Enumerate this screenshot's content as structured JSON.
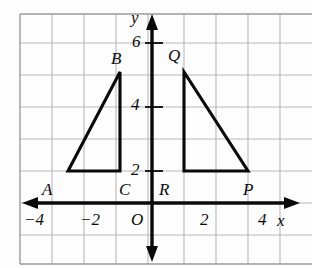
{
  "figure": {
    "kind": "coordinate-plane-geometry-diagram",
    "colors": {
      "grid_line": "#b9b9b9",
      "grid_border": "#9a9a9a",
      "axis": "#0a0a0a",
      "shape_stroke": "#0a0a0a",
      "background": "#fdfdfd",
      "label_text": "#0a0a0a"
    },
    "grid": {
      "cell_px": 32,
      "x_min": -4.125,
      "x_max": 5.0,
      "y_min": -1.9,
      "y_max": 5.9,
      "show_grid": true
    },
    "axes": {
      "x_axis_label": "x",
      "y_axis_label": "y",
      "origin_label": "O",
      "x_ticks": [
        {
          "value": -4,
          "label": "−4"
        },
        {
          "value": -2,
          "label": "−2"
        },
        {
          "value": 2,
          "label": "2"
        },
        {
          "value": 4,
          "label": "4"
        }
      ],
      "y_ticks": [
        {
          "value": 2,
          "label": "2"
        },
        {
          "value": 4,
          "label": "4"
        },
        {
          "value": 6,
          "label": "6"
        }
      ]
    },
    "shapes": [
      {
        "name": "triangle-abc",
        "vertices": [
          {
            "label": "A",
            "x": -3,
            "y": 1
          },
          {
            "label": "B",
            "x": -1,
            "y": 5
          },
          {
            "label": "C",
            "x": -1,
            "y": 1
          }
        ]
      },
      {
        "name": "triangle-pqr",
        "vertices": [
          {
            "label": "R",
            "x": 1,
            "y": 1
          },
          {
            "label": "Q",
            "x": 1,
            "y": 5
          },
          {
            "label": "P",
            "x": 3,
            "y": 1
          }
        ]
      }
    ],
    "point_labels": [
      {
        "name": "A",
        "text": "A",
        "left": 42,
        "top": 181
      },
      {
        "name": "B",
        "text": "B",
        "left": 111,
        "top": 50
      },
      {
        "name": "C",
        "text": "C",
        "left": 119,
        "top": 181
      },
      {
        "name": "R",
        "text": "R",
        "left": 159,
        "top": 181
      },
      {
        "name": "Q",
        "text": "Q",
        "left": 168,
        "top": 47
      },
      {
        "name": "P",
        "text": "P",
        "left": 243,
        "top": 181
      }
    ],
    "tick_labels": [
      {
        "name": "y-tick-6",
        "text": "6",
        "left": 132,
        "top": 33
      },
      {
        "name": "y-tick-4",
        "text": "4",
        "left": 131,
        "top": 96
      },
      {
        "name": "y-tick-2",
        "text": "2",
        "left": 131,
        "top": 161
      },
      {
        "name": "x-tick-n4",
        "text": "−4",
        "left": 24,
        "top": 211
      },
      {
        "name": "x-tick-n2",
        "text": "−2",
        "left": 80,
        "top": 211
      },
      {
        "name": "origin",
        "text": "O",
        "left": 131,
        "top": 211
      },
      {
        "name": "x-tick-2",
        "text": "2",
        "left": 200,
        "top": 211
      },
      {
        "name": "x-tick-4",
        "text": "4",
        "left": 258,
        "top": 211
      },
      {
        "name": "x-axis-name",
        "text": "x",
        "left": 275,
        "top": 212
      },
      {
        "name": "y-axis-name",
        "text": "y",
        "left": 131,
        "top": 9
      }
    ]
  }
}
